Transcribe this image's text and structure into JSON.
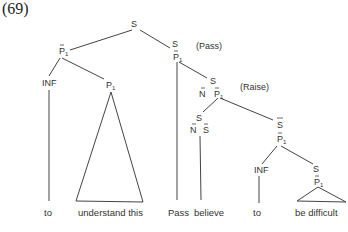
{
  "example_number": "(69)",
  "tree": {
    "root": "S",
    "nodes": {
      "left_p": {
        "cat": "P",
        "hat": true,
        "sub": "1"
      },
      "left_inf": "INF",
      "left_p1": {
        "cat": "P",
        "sub": "1"
      },
      "right_s": "S",
      "right_p": {
        "cat": "P",
        "hat": true,
        "sub": "1"
      },
      "mid_s": "S",
      "mid_n": {
        "cat": "N",
        "hat": true
      },
      "mid_p": {
        "cat": "P",
        "hat": true,
        "sub": "1"
      },
      "low_s": "S",
      "low_n": {
        "cat": "N",
        "hat": true
      },
      "low_shat": {
        "cat": "S",
        "hat": true
      },
      "sbar": {
        "cat": "S",
        "bar": true
      },
      "sbar_p": {
        "cat": "P",
        "hat": true,
        "sub": "1"
      },
      "inner_inf": "INF",
      "inner_s": "S",
      "inner_p": {
        "cat": "P",
        "hat": true,
        "sub": "1"
      }
    },
    "annotations": {
      "pass": "(Pass)",
      "raise": "(Raise)"
    },
    "leaves": [
      "to",
      "understand this",
      "Pass",
      "believe",
      "to",
      "be difficult"
    ]
  }
}
